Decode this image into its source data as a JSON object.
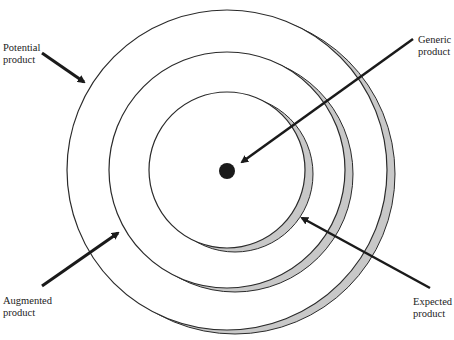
{
  "diagram": {
    "center": {
      "x": 227,
      "y": 170
    },
    "shadow_offset": {
      "dx": 8,
      "dy": 4
    },
    "colors": {
      "stroke": "#2a2a2a",
      "shadow": "#c8c8c8",
      "dot": "#1a1a1a",
      "background": "#ffffff"
    },
    "rings": [
      {
        "name": "potential",
        "r": 160
      },
      {
        "name": "augmented",
        "r": 118
      },
      {
        "name": "expected",
        "r": 78
      }
    ],
    "labels": {
      "potential": {
        "line1": "Potential",
        "line2": "product"
      },
      "generic": {
        "line1": "Generic",
        "line2": "product"
      },
      "augmented": {
        "line1": "Augmented",
        "line2": "product"
      },
      "expected": {
        "line1": "Expected",
        "line2": "product"
      }
    }
  }
}
